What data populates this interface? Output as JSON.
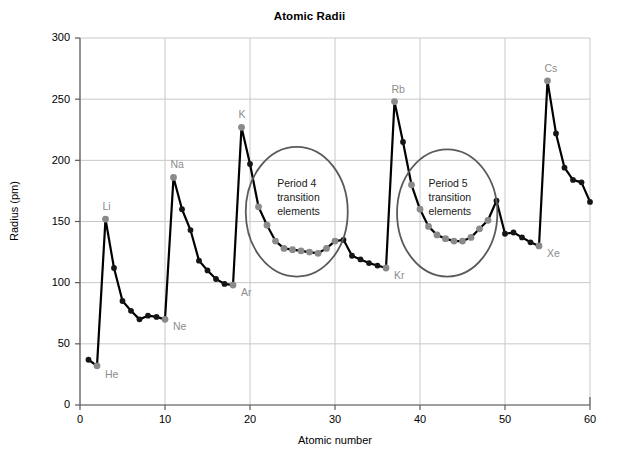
{
  "chart_data": {
    "type": "line",
    "title": "Atomic Radii",
    "xlabel": "Atomic number",
    "ylabel": "Radius (pm)",
    "xlim": [
      0,
      60
    ],
    "ylim": [
      0,
      300
    ],
    "xticks": [
      0,
      10,
      20,
      30,
      40,
      50,
      60
    ],
    "yticks": [
      0,
      50,
      100,
      150,
      200,
      250,
      300
    ],
    "grid": true,
    "legend": "none",
    "series": [
      {
        "name": "Atomic radius",
        "x": [
          1,
          2,
          3,
          4,
          5,
          6,
          7,
          8,
          9,
          10,
          11,
          12,
          13,
          14,
          15,
          16,
          17,
          18,
          19,
          20,
          21,
          22,
          23,
          24,
          25,
          26,
          27,
          28,
          29,
          30,
          31,
          32,
          33,
          34,
          35,
          36,
          37,
          38,
          39,
          40,
          41,
          42,
          43,
          44,
          45,
          46,
          47,
          48,
          49,
          50,
          51,
          52,
          53,
          54,
          55,
          56,
          57,
          58,
          59,
          60
        ],
        "values": [
          37,
          32,
          152,
          112,
          85,
          77,
          70,
          73,
          72,
          70,
          186,
          160,
          143,
          118,
          110,
          103,
          99,
          98,
          227,
          197,
          162,
          147,
          134,
          128,
          127,
          126,
          125,
          124,
          128,
          134,
          135,
          122,
          119,
          116,
          114,
          112,
          248,
          215,
          180,
          160,
          146,
          139,
          136,
          134,
          134,
          137,
          144,
          151,
          167,
          140,
          141,
          137,
          133,
          130,
          265,
          222,
          194,
          184,
          182,
          166
        ],
        "point_colors": [
          "dark",
          "gray",
          "gray",
          "dark",
          "dark",
          "dark",
          "dark",
          "dark",
          "dark",
          "gray",
          "gray",
          "dark",
          "dark",
          "dark",
          "dark",
          "dark",
          "dark",
          "gray",
          "gray",
          "dark",
          "gray",
          "gray",
          "gray",
          "gray",
          "gray",
          "gray",
          "gray",
          "gray",
          "gray",
          "gray",
          "dark",
          "dark",
          "dark",
          "dark",
          "dark",
          "gray",
          "gray",
          "dark",
          "gray",
          "gray",
          "gray",
          "gray",
          "gray",
          "gray",
          "gray",
          "gray",
          "gray",
          "gray",
          "dark",
          "dark",
          "dark",
          "dark",
          "dark",
          "gray",
          "gray",
          "dark",
          "dark",
          "dark",
          "dark",
          "dark"
        ]
      }
    ],
    "point_labels": [
      {
        "symbol": "He",
        "x": 2,
        "y": 32,
        "dx": 8,
        "dy": 12,
        "style": "gray"
      },
      {
        "symbol": "Li",
        "x": 3,
        "y": 152,
        "dx": -3,
        "dy": -9,
        "style": "gray"
      },
      {
        "symbol": "Ne",
        "x": 10,
        "y": 70,
        "dx": 8,
        "dy": 11,
        "style": "gray"
      },
      {
        "symbol": "Na",
        "x": 11,
        "y": 186,
        "dx": -3,
        "dy": -9,
        "style": "gray"
      },
      {
        "symbol": "Ar",
        "x": 18,
        "y": 98,
        "dx": 8,
        "dy": 11,
        "style": "gray"
      },
      {
        "symbol": "K",
        "x": 19,
        "y": 227,
        "dx": -3,
        "dy": -9,
        "style": "gray"
      },
      {
        "symbol": "Kr",
        "x": 36,
        "y": 112,
        "dx": 8,
        "dy": 11,
        "style": "gray"
      },
      {
        "symbol": "Rb",
        "x": 37,
        "y": 248,
        "dx": -3,
        "dy": -9,
        "style": "gray"
      },
      {
        "symbol": "Xe",
        "x": 54,
        "y": 130,
        "dx": 8,
        "dy": 11,
        "style": "gray"
      },
      {
        "symbol": "Cs",
        "x": 55,
        "y": 265,
        "dx": -3,
        "dy": -9,
        "style": "gray"
      }
    ],
    "annotations": [
      {
        "id": "period-4",
        "lines": [
          "Period 4",
          "transition",
          "elements"
        ],
        "ellipse": {
          "cx_data": 25.5,
          "cy_data": 158,
          "rx_data": 6.0,
          "ry_data": 53
        },
        "text_x_data": 23.2,
        "text_y_data": 178
      },
      {
        "id": "period-5",
        "lines": [
          "Period 5",
          "transition",
          "elements"
        ],
        "ellipse": {
          "cx_data": 43.2,
          "cy_data": 157,
          "rx_data": 5.9,
          "ry_data": 52
        },
        "text_x_data": 41.0,
        "text_y_data": 178
      }
    ],
    "colors": {
      "line": "#000000",
      "point_dark": "#151515",
      "point_gray": "#8a8a8a",
      "grid": "#c8c8c8",
      "axis": "#5a5a5a",
      "annotation_circle": "#5a5a5a",
      "label_gray": "#8c8c8c",
      "text": "#000000",
      "background": "#ffffff"
    }
  }
}
